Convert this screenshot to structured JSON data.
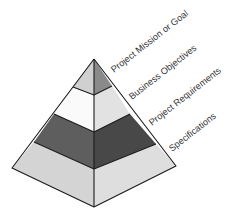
{
  "diagram": {
    "type": "pyramid",
    "layers": [
      {
        "id": "mission",
        "label": "Project Mission or Goal",
        "left_color": "#d0d0d0",
        "right_color": "#8a8a8a"
      },
      {
        "id": "objectives",
        "label": "Business Objectives",
        "left_color": "#fafafa",
        "right_color": "#e2e2e2"
      },
      {
        "id": "requirements",
        "label": "Project Requirements",
        "left_color": "#5e5e5e",
        "right_color": "#484848"
      },
      {
        "id": "specifications",
        "label": "Specifications",
        "left_color": "#d4d4d4",
        "right_color": "#dedede"
      }
    ]
  }
}
